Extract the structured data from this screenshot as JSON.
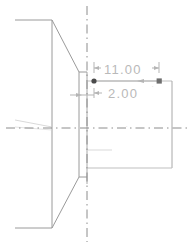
{
  "app": {
    "view_name": "cad-section-view",
    "background_color": "#ffffff"
  },
  "colors": {
    "object_line": "#9a9a9a",
    "thin_line": "#c0c0c0",
    "center_line": "#8c8c8c",
    "dimension_line": "#b5b5b5",
    "dimension_text": "#b9b9b9",
    "grip_point": "#4a4a4a",
    "grip_square": "#6e6e6e"
  },
  "dimensions": [
    {
      "id": "dim-overall-length",
      "value": "11.00",
      "orientation": "horizontal",
      "position": "above",
      "start_x": 94,
      "end_x": 159,
      "line_y": 80
    },
    {
      "id": "dim-flange-thickness",
      "value": "2.00",
      "orientation": "horizontal",
      "position": "below",
      "start_x": 94,
      "end_x": 159,
      "line_y": 80
    }
  ],
  "annotations": {
    "left_grip_tag": "⋅",
    "right_grip_tag": "⋅",
    "center_tag": "⋅"
  },
  "geometry": {
    "center_line_horizontal_y": 128,
    "center_line_vertical_x": 87,
    "rectangle": {
      "left": 88,
      "top": 81,
      "right": 172,
      "bottom": 168
    },
    "flange": {
      "left": 78,
      "top": 72,
      "right": 87,
      "bottom": 184
    },
    "cone_top_y": 20,
    "cone_bottom_y": 228,
    "body_left_x": 52,
    "body_edge_x": 15
  },
  "grips": [
    {
      "id": "grip-left",
      "shape": "dot",
      "x": 94,
      "y": 81
    },
    {
      "id": "grip-right",
      "shape": "square",
      "x": 159,
      "y": 81
    }
  ]
}
